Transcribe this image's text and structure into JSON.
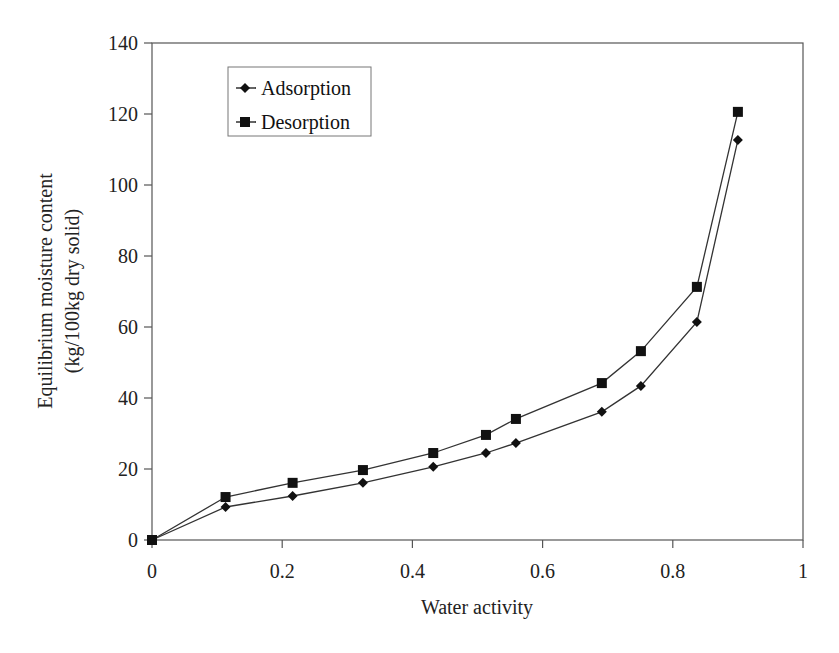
{
  "chart_data": {
    "type": "line",
    "title": "",
    "xlabel": "Water activity",
    "ylabel_line1": "Equilibrium moisture content",
    "ylabel_line2": "(kg/100kg dry solid)",
    "xlim": [
      0,
      1
    ],
    "ylim": [
      0,
      140
    ],
    "xticks": [
      "0",
      "0.2",
      "0.4",
      "0.6",
      "0.8",
      "1"
    ],
    "xtick_values": [
      0,
      0.2,
      0.4,
      0.6,
      0.8,
      1
    ],
    "yticks": [
      "0",
      "20",
      "40",
      "60",
      "80",
      "100",
      "120",
      "140"
    ],
    "ytick_values": [
      0,
      20,
      40,
      60,
      80,
      100,
      120,
      140
    ],
    "grid": false,
    "legend_position": "upper-left-inside",
    "x": [
      0,
      0.113,
      0.216,
      0.324,
      0.432,
      0.513,
      0.559,
      0.691,
      0.751,
      0.837,
      0.9
    ],
    "series": [
      {
        "name": "Adsorption",
        "marker": "diamond",
        "color": "#111111",
        "values": [
          0,
          9.3,
          12.4,
          16.1,
          20.6,
          24.5,
          27.3,
          36.1,
          43.4,
          61.4,
          112.7
        ]
      },
      {
        "name": "Desorption",
        "marker": "square",
        "color": "#111111",
        "values": [
          0,
          12.1,
          16.1,
          19.7,
          24.5,
          29.6,
          34.1,
          44.2,
          53.2,
          71.3,
          120.6
        ]
      }
    ]
  },
  "legend": {
    "items": [
      {
        "label": "Adsorption"
      },
      {
        "label": "Desorption"
      }
    ]
  }
}
